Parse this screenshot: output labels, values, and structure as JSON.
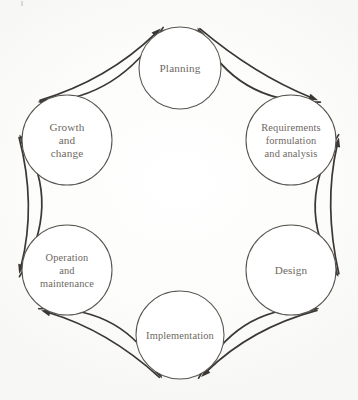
{
  "diagram": {
    "type": "cycle",
    "background_color": "#fdfdfd",
    "node_stroke_color": "#585450",
    "arrow_color": "#3b3733",
    "label_color": "#6e6862",
    "nodes": [
      {
        "id": "planning",
        "label": "Planning",
        "lines": [
          "Planning"
        ],
        "cx": 180,
        "cy": 68,
        "r": 41
      },
      {
        "id": "requirements",
        "label": "Requirements formulation and analysis",
        "lines": [
          "Requirements",
          "formulation",
          "and analysis"
        ],
        "cx": 291,
        "cy": 140,
        "r": 45
      },
      {
        "id": "design",
        "label": "Design",
        "lines": [
          "Design"
        ],
        "cx": 291,
        "cy": 270,
        "r": 45
      },
      {
        "id": "implementation",
        "label": "Implementation",
        "lines": [
          "Implementation"
        ],
        "cx": 180,
        "cy": 335,
        "r": 44
      },
      {
        "id": "operation",
        "label": "Operation and maintenance",
        "lines": [
          "Operation",
          "and",
          "maintenance"
        ],
        "cx": 67,
        "cy": 270,
        "r": 45
      },
      {
        "id": "growth",
        "label": "Growth and change",
        "lines": [
          "Growth",
          "and",
          "change"
        ],
        "cx": 67,
        "cy": 140,
        "r": 45
      }
    ],
    "edges": [
      {
        "id": "planning-to-requirements",
        "from": "planning",
        "to": "requirements",
        "direction": "clockwise",
        "side": "outer"
      },
      {
        "id": "requirements-to-planning",
        "from": "requirements",
        "to": "planning",
        "direction": "counter-clockwise",
        "side": "inner"
      },
      {
        "id": "requirements-to-design",
        "from": "requirements",
        "to": "design",
        "direction": "clockwise",
        "side": "inner"
      },
      {
        "id": "design-to-requirements",
        "from": "design",
        "to": "requirements",
        "direction": "counter-clockwise",
        "side": "outer"
      },
      {
        "id": "design-to-implementation",
        "from": "design",
        "to": "implementation",
        "direction": "clockwise",
        "side": "outer"
      },
      {
        "id": "implementation-to-design",
        "from": "implementation",
        "to": "design",
        "direction": "counter-clockwise",
        "side": "inner"
      },
      {
        "id": "implementation-to-operation",
        "from": "implementation",
        "to": "operation",
        "direction": "clockwise",
        "side": "outer"
      },
      {
        "id": "operation-to-implementation",
        "from": "operation",
        "to": "implementation",
        "direction": "counter-clockwise",
        "side": "inner"
      },
      {
        "id": "operation-to-growth",
        "from": "operation",
        "to": "growth",
        "direction": "clockwise",
        "side": "inner"
      },
      {
        "id": "growth-to-operation",
        "from": "growth",
        "to": "operation",
        "direction": "counter-clockwise",
        "side": "outer"
      },
      {
        "id": "growth-to-planning",
        "from": "growth",
        "to": "planning",
        "direction": "clockwise",
        "side": "outer"
      },
      {
        "id": "planning-to-growth",
        "from": "planning",
        "to": "growth",
        "direction": "counter-clockwise",
        "side": "inner"
      }
    ]
  }
}
